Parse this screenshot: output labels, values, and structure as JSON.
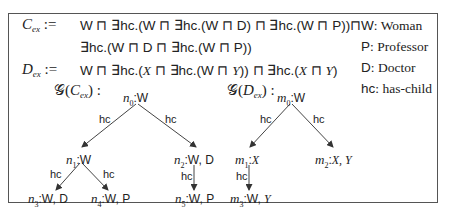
{
  "definitions": {
    "c_ex": {
      "name": "C",
      "subscript": "ex",
      "assign": ":=",
      "line1": "W ⊓ ∃hc.(W ⊓ ∃hc.(W ⊓ D) ⊓ ∃hc.(W ⊓ P))⊓",
      "line2": "∃hc.(W ⊓ D ⊓ ∃hc.(W ⊓ P))"
    },
    "d_ex": {
      "name": "D",
      "subscript": "ex",
      "assign": ":=",
      "line1_parts": [
        "W ⊓ ∃hc.(",
        "X",
        " ⊓ ∃hc.(W ⊓ ",
        "Y",
        ")) ⊓ ∃hc.(",
        "X",
        " ⊓ ",
        "Y",
        ")"
      ]
    }
  },
  "legend": [
    {
      "key": "W",
      "desc": "Woman"
    },
    {
      "key": "P",
      "desc": "Professor"
    },
    {
      "key": "D",
      "desc": "Doctor"
    },
    {
      "key": "hc",
      "desc": "has-child"
    }
  ],
  "graphs": {
    "gc": {
      "label_prefix": "𝒢(",
      "label_name": "C",
      "label_sub": "ex",
      "label_suffix": ") :",
      "nodes": [
        {
          "id": "n0",
          "name": "n",
          "sub": "0",
          "labels": "W"
        },
        {
          "id": "n1",
          "name": "n",
          "sub": "1",
          "labels": "W"
        },
        {
          "id": "n2",
          "name": "n",
          "sub": "2",
          "labels": "W, D"
        },
        {
          "id": "n3",
          "name": "n",
          "sub": "3",
          "labels": "W, D"
        },
        {
          "id": "n4",
          "name": "n",
          "sub": "4",
          "labels": "W, P"
        },
        {
          "id": "n5",
          "name": "n",
          "sub": "5",
          "labels": "W, P"
        }
      ],
      "edges": [
        {
          "from": "n0",
          "to": "n1",
          "label": "hc"
        },
        {
          "from": "n0",
          "to": "n2",
          "label": "hc"
        },
        {
          "from": "n1",
          "to": "n3",
          "label": "hc"
        },
        {
          "from": "n1",
          "to": "n4",
          "label": "hc"
        },
        {
          "from": "n2",
          "to": "n5",
          "label": "hc"
        }
      ]
    },
    "gd": {
      "label_prefix": "𝒢(",
      "label_name": "D",
      "label_sub": "ex",
      "label_suffix": ") :",
      "nodes": [
        {
          "id": "m0",
          "name": "m",
          "sub": "0",
          "labels": "W",
          "var": false
        },
        {
          "id": "m1",
          "name": "m",
          "sub": "1",
          "labels": "X",
          "var": true
        },
        {
          "id": "m2",
          "name": "m",
          "sub": "2",
          "labels": "X, Y",
          "var": true
        },
        {
          "id": "m3",
          "name": "m",
          "sub": "3",
          "labels_plain": "W, ",
          "labels_var": "Y"
        }
      ],
      "edges": [
        {
          "from": "m0",
          "to": "m1",
          "label": "hc"
        },
        {
          "from": "m0",
          "to": "m2",
          "label": "hc"
        },
        {
          "from": "m1",
          "to": "m3",
          "label": "hc"
        }
      ]
    }
  }
}
